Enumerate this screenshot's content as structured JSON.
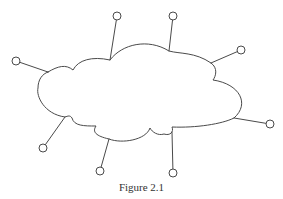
{
  "figure": {
    "caption": "Figure 2.1",
    "colors": {
      "stroke": "#4a4a4a",
      "background": "#ffffff",
      "caption": "#333333"
    },
    "cloud": {
      "label": "network-cloud",
      "shape": "cloud"
    },
    "nodes": [
      {
        "id": "node-left",
        "cx": 16,
        "cy": 61,
        "r": 4,
        "attach": [
          48,
          72
        ]
      },
      {
        "id": "node-top-left",
        "cx": 117,
        "cy": 16,
        "r": 4,
        "attach": [
          110,
          60
        ]
      },
      {
        "id": "node-top-right",
        "cx": 173,
        "cy": 16,
        "r": 4,
        "attach": [
          169,
          51
        ]
      },
      {
        "id": "node-right-upper",
        "cx": 241,
        "cy": 50,
        "r": 4,
        "attach": [
          211,
          63
        ]
      },
      {
        "id": "node-right-lower",
        "cx": 270,
        "cy": 124,
        "r": 4,
        "attach": [
          234,
          118
        ]
      },
      {
        "id": "node-bottom-left",
        "cx": 43,
        "cy": 148,
        "r": 4,
        "attach": [
          65,
          117
        ]
      },
      {
        "id": "node-bottom-middle",
        "cx": 100,
        "cy": 171,
        "r": 4,
        "attach": [
          109,
          139
        ]
      },
      {
        "id": "node-bottom-right",
        "cx": 173,
        "cy": 173,
        "r": 4,
        "attach": [
          172,
          132
        ]
      }
    ]
  }
}
